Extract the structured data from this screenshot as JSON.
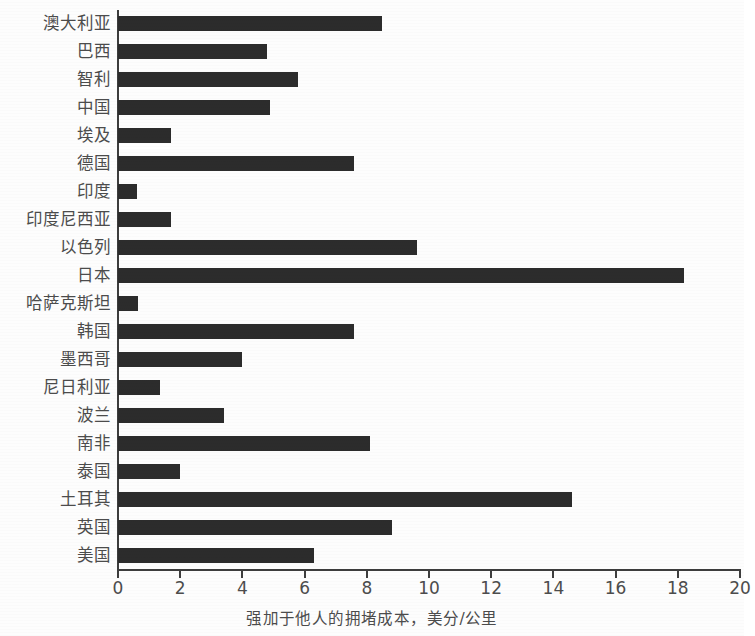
{
  "chart_data": {
    "type": "bar",
    "orientation": "horizontal",
    "title": "",
    "xlabel": "强加于他人的拥堵成本，美分/公里",
    "ylabel": "",
    "xlim": [
      0,
      20
    ],
    "xticks": [
      0,
      2,
      4,
      6,
      8,
      10,
      12,
      14,
      16,
      18,
      20
    ],
    "xtick_labels": [
      "0",
      "2",
      "4",
      "6",
      "8",
      "10",
      "12",
      "14",
      "16",
      "18",
      "20"
    ],
    "grid": false,
    "legend": false,
    "bar_color": "#2c2c2c",
    "categories": [
      "澳大利亚",
      "巴西",
      "智利",
      "中国",
      "埃及",
      "德国",
      "印度",
      "印度尼西亚",
      "以色列",
      "日本",
      "哈萨克斯坦",
      "韩国",
      "墨西哥",
      "尼日利亚",
      "波兰",
      "南非",
      "泰国",
      "土耳其",
      "英国",
      "美国"
    ],
    "values": [
      8.5,
      4.8,
      5.8,
      4.9,
      1.7,
      7.6,
      0.6,
      1.7,
      9.6,
      18.2,
      0.65,
      7.6,
      4.0,
      1.35,
      3.4,
      8.1,
      2.0,
      14.6,
      8.8,
      6.3
    ]
  }
}
